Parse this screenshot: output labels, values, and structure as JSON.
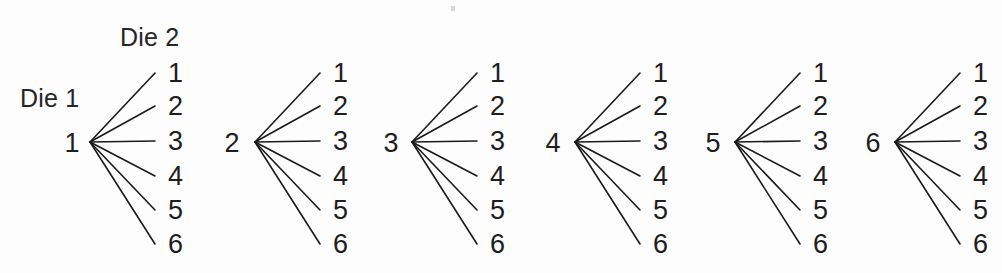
{
  "diagram": {
    "title_die1": "Die 1",
    "title_die2": "Die 2",
    "background_color": "#fdfdfd",
    "line_color": "#1b1b1b",
    "text_color": "#1e1e1e"
  },
  "chart_data": {
    "type": "diagram",
    "diagram_type": "probability-tree",
    "title": "",
    "xlabel": "",
    "ylabel": "",
    "level1_label": "Die 1",
    "level2_label": "Die 2",
    "level1_values": [
      "1",
      "2",
      "3",
      "4",
      "5",
      "6"
    ],
    "level2_values": [
      "1",
      "2",
      "3",
      "4",
      "5",
      "6"
    ],
    "branches_per_node": 6,
    "total_outcomes": 36,
    "clusters": [
      {
        "root": "1",
        "root_x": 72,
        "vertex_x": 90,
        "vertex_y": 142,
        "leaves": [
          "1",
          "2",
          "3",
          "4",
          "5",
          "6"
        ]
      },
      {
        "root": "2",
        "root_x": 232,
        "vertex_x": 255,
        "vertex_y": 142,
        "leaves": [
          "1",
          "2",
          "3",
          "4",
          "5",
          "6"
        ]
      },
      {
        "root": "3",
        "root_x": 391,
        "vertex_x": 412,
        "vertex_y": 142,
        "leaves": [
          "1",
          "2",
          "3",
          "4",
          "5",
          "6"
        ]
      },
      {
        "root": "4",
        "root_x": 553,
        "vertex_x": 575,
        "vertex_y": 142,
        "leaves": [
          "1",
          "2",
          "3",
          "4",
          "5",
          "6"
        ]
      },
      {
        "root": "5",
        "root_x": 713,
        "vertex_x": 735,
        "vertex_y": 142,
        "leaves": [
          "1",
          "2",
          "3",
          "4",
          "5",
          "6"
        ]
      },
      {
        "root": "6",
        "root_x": 873,
        "vertex_x": 895,
        "vertex_y": 142,
        "leaves": [
          "1",
          "2",
          "3",
          "4",
          "5",
          "6"
        ]
      }
    ],
    "leaf_y_positions": [
      82,
      115,
      150,
      185,
      219,
      253
    ],
    "leaf_label_dx": 78,
    "branch_end_dx": 65
  }
}
